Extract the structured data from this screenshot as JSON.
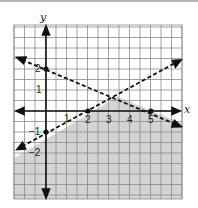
{
  "chart_data": {
    "type": "line",
    "title": "",
    "subtitle": "System of linear inequalities",
    "xlabel": "x",
    "ylabel": "y",
    "xlim": [
      -1.5,
      6.5
    ],
    "ylim": [
      -4.25,
      4.1
    ],
    "grid": true,
    "grid_step": 0.5,
    "x_tick_labels": [
      "1",
      "2",
      "3",
      "4",
      "5"
    ],
    "y_tick_labels": [
      "2",
      "1",
      "-1",
      "-2"
    ],
    "series": [
      {
        "name": "boundary line 1",
        "equation": "y = -0.4x + 2",
        "style": "dashed",
        "points": [
          {
            "x": 0,
            "y": 2
          },
          {
            "x": 5,
            "y": 0
          }
        ]
      },
      {
        "name": "boundary line 2",
        "equation": "y = 0.5x - 1",
        "style": "dashed",
        "points": [
          {
            "x": 0,
            "y": -1
          },
          {
            "x": 2,
            "y": 0
          }
        ]
      }
    ],
    "shaded_region": "y < 0.5x - 1 and y < -0.4x + 2",
    "colors": {
      "shade": "#d4d4d4",
      "grid": "#8a8a8a",
      "axis": "#111111",
      "background": "#ffffff"
    }
  },
  "labels": {
    "x_axis": "x",
    "y_axis": "y",
    "ticks": {
      "x1": "1",
      "x2": "2",
      "x3": "3",
      "x4": "4",
      "x5": "5",
      "y2": "2",
      "y1": "1",
      "yn1": "−1",
      "yn2": "−2"
    }
  }
}
